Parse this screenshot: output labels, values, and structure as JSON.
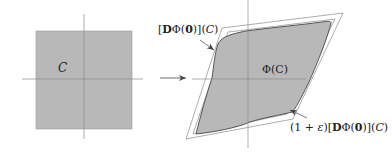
{
  "diagram": {
    "type": "geometric-transformation",
    "colors": {
      "fill": "#b8b8b8",
      "axis": "#8a8a8a",
      "outline": "#7a7a7a",
      "blob_edge": "#555555",
      "arrow": "#444444",
      "text": "#222222"
    },
    "left_panel": {
      "shape": "square",
      "label": "C"
    },
    "arrow": {
      "direction": "right"
    },
    "right_panel": {
      "image_label": "Φ(C)",
      "inner_parallelogram_label": {
        "open": "[",
        "D": "D",
        "phi": "Φ(",
        "zero": "0",
        "close": ")](",
        "C": "C",
        "end": ")"
      },
      "outer_parallelogram_label": {
        "prefix": "(1 + ",
        "eps": "ε",
        "mid": ")[",
        "D": "D",
        "phi": "Φ(",
        "zero": "0",
        "close": ")](",
        "C": "C",
        "end": ")"
      }
    }
  }
}
